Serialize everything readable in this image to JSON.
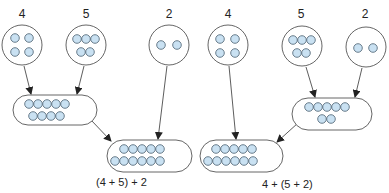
{
  "colors": {
    "dot_fill": "#c9e1f2",
    "dot_stroke": "#4a6070",
    "outline": "#555555",
    "arrow": "#333333"
  },
  "left_group": {
    "caption": "(4 + 5) + 2",
    "sets": [
      {
        "label": "4",
        "count": 4
      },
      {
        "label": "5",
        "count": 5
      },
      {
        "label": "2",
        "count": 2
      }
    ],
    "intermediate": {
      "count": 9,
      "from": [
        "4",
        "5"
      ]
    },
    "result": {
      "count": 11,
      "from": [
        "4 + 5",
        "2"
      ]
    }
  },
  "right_group": {
    "caption": "4 + (5 + 2)",
    "sets": [
      {
        "label": "4",
        "count": 4
      },
      {
        "label": "5",
        "count": 5
      },
      {
        "label": "2",
        "count": 2
      }
    ],
    "intermediate": {
      "count": 7,
      "from": [
        "5",
        "2"
      ]
    },
    "result": {
      "count": 11,
      "from": [
        "4",
        "5 + 2"
      ]
    }
  }
}
